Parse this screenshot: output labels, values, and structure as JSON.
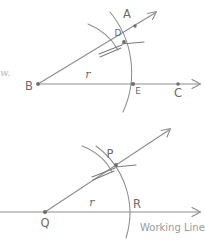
{
  "figure": {
    "canvas": {
      "width": 205,
      "height": 240
    },
    "stroke_color": "#8e8e8e",
    "label_color": "#6b6b6b",
    "caption_color": "#9a9a9a",
    "background": "#ffffff"
  },
  "margin_text": {
    "fragment": "w."
  },
  "upper_figure": {
    "name": "given-angle-figure",
    "vertex_label": "B",
    "ray_tip_label": "A",
    "baseline_end_label": "C",
    "arc_ray_intersection_label": "D",
    "arc_baseline_intersection_label": "E",
    "radius_label": "r",
    "points": {
      "B": {
        "x": 38,
        "y": 84
      },
      "D": {
        "x": 124,
        "y": 42
      },
      "A": {
        "x": 139,
        "y": 27
      },
      "E": {
        "x": 133,
        "y": 84
      },
      "C": {
        "x": 178,
        "y": 84
      },
      "ray_arrow_tip": {
        "x": 156,
        "y": 12
      },
      "baseline_arrow_tip": {
        "x": 200,
        "y": 84
      }
    },
    "arc": {
      "center_x": 38,
      "center_y": 84,
      "radius": 95
    }
  },
  "lower_figure": {
    "name": "constructed-angle-figure",
    "vertex_label": "Q",
    "arc_ray_intersection_label": "P",
    "arc_baseline_intersection_label": "R",
    "radius_label": "r",
    "baseline_caption": "Working Line",
    "points": {
      "Q": {
        "x": 45,
        "y": 212
      },
      "P": {
        "x": 116,
        "y": 165
      },
      "R": {
        "x": 128,
        "y": 212
      },
      "ray_arrow_tip": {
        "x": 170,
        "y": 129
      },
      "baseline_arrow_tip": {
        "x": 200,
        "y": 212
      },
      "baseline_start": {
        "x": 0,
        "y": 212
      }
    },
    "arc": {
      "center_x": 45,
      "center_y": 212,
      "radius": 83
    }
  }
}
